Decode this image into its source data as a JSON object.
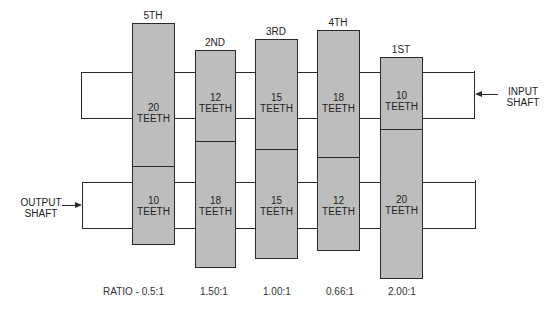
{
  "diagram": {
    "gears": [
      {
        "name": "5TH",
        "top_teeth": "20",
        "bottom_teeth": "10",
        "ratio": "RATIO - 0.5:1"
      },
      {
        "name": "2ND",
        "top_teeth": "12",
        "bottom_teeth": "18",
        "ratio": "1.50:1"
      },
      {
        "name": "3RD",
        "top_teeth": "15",
        "bottom_teeth": "15",
        "ratio": "1.00:1"
      },
      {
        "name": "4TH",
        "top_teeth": "18",
        "bottom_teeth": "12",
        "ratio": "0.66:1"
      },
      {
        "name": "1ST",
        "top_teeth": "10",
        "bottom_teeth": "20",
        "ratio": "2.00:1"
      }
    ],
    "teeth_word": "TEETH",
    "input_shaft": {
      "line1": "INPUT",
      "line2": "SHAFT"
    },
    "output_shaft": {
      "line1": "OUTPUT",
      "line2": "SHAFT"
    },
    "colors": {
      "gear_fill": "#bdbdbd",
      "line": "#2a2a2a",
      "background": "#ffffff"
    }
  }
}
